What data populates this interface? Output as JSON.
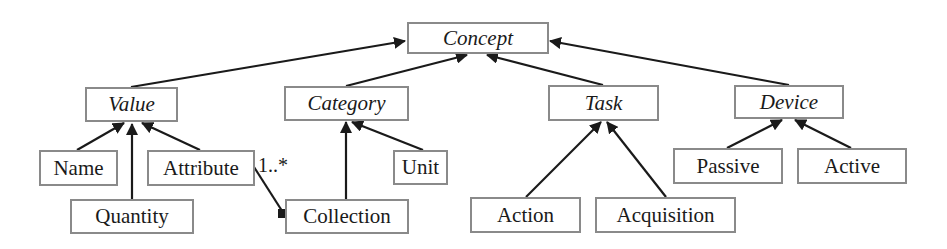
{
  "diagram": {
    "type": "uml-class-hierarchy",
    "nodes": {
      "concept": {
        "label": "Concept",
        "abstract": true
      },
      "value": {
        "label": "Value",
        "abstract": true
      },
      "category": {
        "label": "Category",
        "abstract": true
      },
      "task": {
        "label": "Task",
        "abstract": true
      },
      "device": {
        "label": "Device",
        "abstract": true
      },
      "name": {
        "label": "Name",
        "abstract": false
      },
      "attribute": {
        "label": "Attribute",
        "abstract": false
      },
      "quantity": {
        "label": "Quantity",
        "abstract": false
      },
      "unit": {
        "label": "Unit",
        "abstract": false
      },
      "collection": {
        "label": "Collection",
        "abstract": false
      },
      "action": {
        "label": "Action",
        "abstract": false
      },
      "acquisition": {
        "label": "Acquisition",
        "abstract": false
      },
      "passive": {
        "label": "Passive",
        "abstract": false
      },
      "active": {
        "label": "Active",
        "abstract": false
      }
    },
    "edges": [
      {
        "from": "Value",
        "to": "Concept",
        "kind": "generalization"
      },
      {
        "from": "Category",
        "to": "Concept",
        "kind": "generalization"
      },
      {
        "from": "Task",
        "to": "Concept",
        "kind": "generalization"
      },
      {
        "from": "Device",
        "to": "Concept",
        "kind": "generalization"
      },
      {
        "from": "Name",
        "to": "Value",
        "kind": "generalization"
      },
      {
        "from": "Quantity",
        "to": "Value",
        "kind": "generalization"
      },
      {
        "from": "Attribute",
        "to": "Value",
        "kind": "generalization"
      },
      {
        "from": "Collection",
        "to": "Category",
        "kind": "generalization"
      },
      {
        "from": "Unit",
        "to": "Category",
        "kind": "generalization"
      },
      {
        "from": "Action",
        "to": "Task",
        "kind": "generalization"
      },
      {
        "from": "Acquisition",
        "to": "Task",
        "kind": "generalization"
      },
      {
        "from": "Passive",
        "to": "Device",
        "kind": "generalization"
      },
      {
        "from": "Active",
        "to": "Device",
        "kind": "generalization"
      },
      {
        "from": "Collection",
        "to": "Attribute",
        "kind": "composition",
        "multiplicity": "1..*"
      }
    ],
    "multiplicity_label": "1..*",
    "colors": {
      "box_border": "#8a8a8a",
      "line": "#1a1a1a",
      "text": "#1a1a1a",
      "background": "#ffffff"
    }
  }
}
